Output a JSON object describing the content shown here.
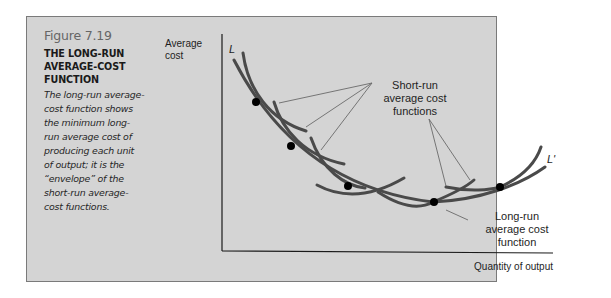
{
  "figure": {
    "number": "Figure 7.19",
    "title_lines": [
      "THE LONG-RUN",
      "AVERAGE-COST",
      "FUNCTION"
    ],
    "description_lines": [
      "The long-run average-",
      "cost function shows",
      "the minimum long-",
      "run average cost of",
      "producing each unit",
      "of output; it is the",
      "“envelope” of the",
      "short-run average-",
      "cost functions."
    ]
  },
  "diagram": {
    "y_axis_label_lines": [
      "Average",
      "cost"
    ],
    "x_axis_label": "Quantity of output",
    "curve_start_label": "L",
    "curve_end_label": "L'",
    "short_run_label_lines": [
      "Short-run",
      "average cost",
      "functions"
    ],
    "long_run_label_lines": [
      "Long-run",
      "average cost",
      "function"
    ],
    "colors": {
      "panel_bg": "#d4d4d4",
      "curve": "#4a4a4a",
      "tangent_point": "#000000",
      "leader_line": "#6a6a6a"
    }
  }
}
